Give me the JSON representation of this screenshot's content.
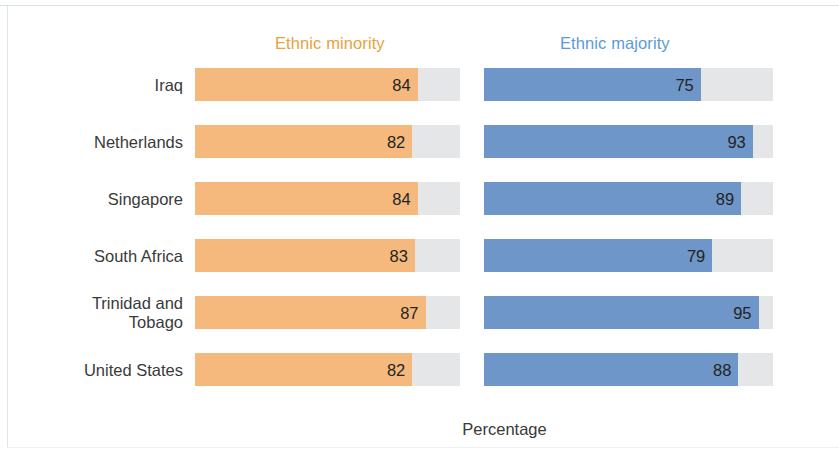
{
  "legend": {
    "minority": "Ethnic minority",
    "majority": "Ethnic majority"
  },
  "axis": {
    "x_title": "Percentage"
  },
  "colors": {
    "minority_bar": "#F5B97D",
    "majority_bar": "#6E96C8",
    "track": "#E4E6E8",
    "minority_legend_text": "#E8A33D",
    "majority_legend_text": "#5B9BD5",
    "value_text": "#232323",
    "category_text": "#3A3A3A",
    "background": "#FFFFFF"
  },
  "rows": [
    {
      "category": "Iraq",
      "minority": "84",
      "majority": "75"
    },
    {
      "category": "Netherlands",
      "minority": "82",
      "majority": "93"
    },
    {
      "category": "Singapore",
      "minority": "84",
      "majority": "89"
    },
    {
      "category": "South Africa",
      "minority": "83",
      "majority": "79"
    },
    {
      "category": "Trinidad and\nTobago",
      "minority": "87",
      "majority": "95"
    },
    {
      "category": "United States",
      "minority": "82",
      "majority": "88"
    }
  ],
  "chart_data": {
    "type": "bar",
    "title": "",
    "subtitle": "",
    "orientation": "horizontal",
    "xlabel": "Percentage",
    "ylabel": "",
    "xlim": [
      0,
      100
    ],
    "grid": false,
    "legend_position": "top",
    "categories": [
      "Iraq",
      "Netherlands",
      "Singapore",
      "South Africa",
      "Trinidad and Tobago",
      "United States"
    ],
    "series": [
      {
        "name": "Ethnic minority",
        "color": "#F5B97D",
        "values": [
          84,
          82,
          84,
          83,
          87,
          82
        ]
      },
      {
        "name": "Ethnic majority",
        "color": "#6E96C8",
        "values": [
          75,
          93,
          89,
          79,
          95,
          88
        ]
      }
    ]
  }
}
